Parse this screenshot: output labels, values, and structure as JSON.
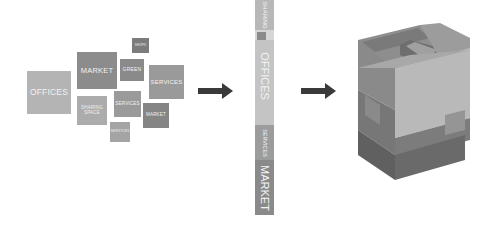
{
  "diagram": {
    "left_cluster": {
      "boxes": [
        {
          "label": "OFFICES",
          "color": "#b4b4b4"
        },
        {
          "label": "MARKET",
          "color": "#8c8c8c"
        },
        {
          "label": "SHOPS",
          "color": "#7c7c7c"
        },
        {
          "label": "GREEN",
          "color": "#8a8a8a"
        },
        {
          "label": "SERVICES",
          "color": "#9a9a9a"
        },
        {
          "label": "SHARING SPACE",
          "color": "#acacac"
        },
        {
          "label": "SERVICES",
          "color": "#9a9a9a"
        },
        {
          "label": "MARKET",
          "color": "#858585"
        },
        {
          "label": "SERVICES",
          "color": "#a4a4a4"
        }
      ]
    },
    "arrows": [
      {
        "direction": "right",
        "color": "#3a3a3a"
      },
      {
        "direction": "right",
        "color": "#3a3a3a"
      }
    ],
    "middle_strip": {
      "segments": [
        {
          "label": "SHARING",
          "color": "#b8b8b8"
        },
        {
          "label": "",
          "color": "#8a8a8a"
        },
        {
          "label": "OFFICES",
          "color": "#c4c4c4"
        },
        {
          "label": "SERVICES",
          "color": "#9c9c9c"
        },
        {
          "label": "MARKET",
          "color": "#8a8a8a"
        }
      ]
    },
    "model_3d": {
      "description": "Stacked building volume massing model",
      "colors": {
        "top": "#8c8c8c",
        "light_face": "#b8b8b8",
        "dark_face": "#6e6e6e",
        "mid_face": "#9a9a9a"
      }
    }
  }
}
